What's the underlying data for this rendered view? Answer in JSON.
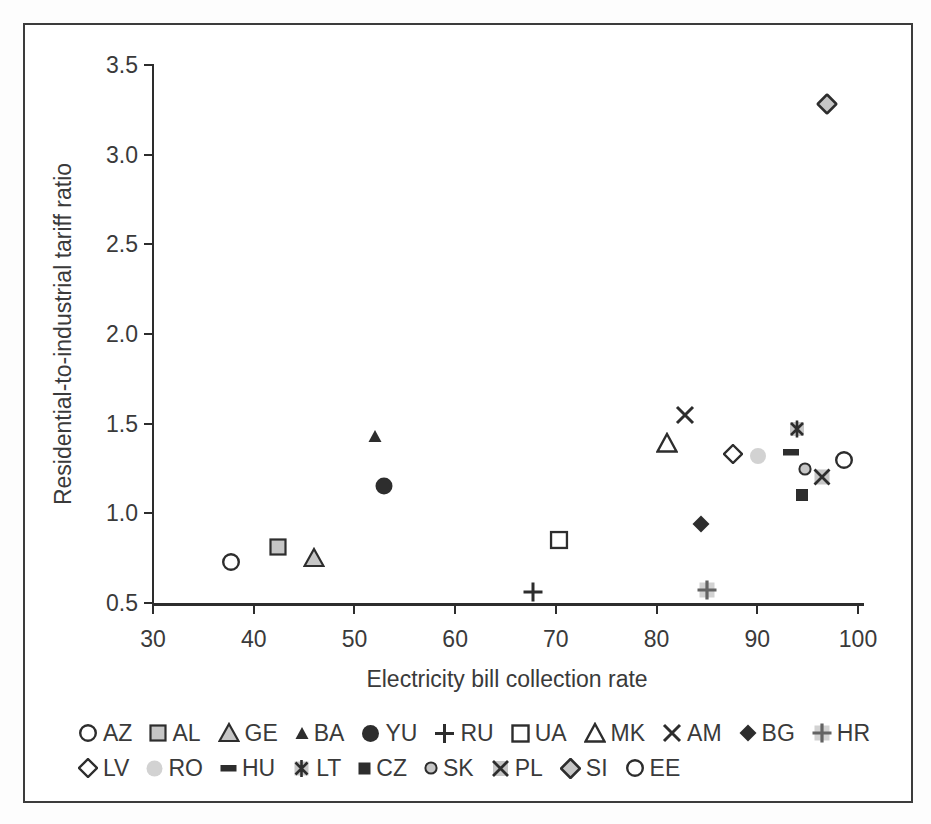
{
  "figure": {
    "border_color": "#3c3c3c",
    "background": "#ffffff"
  },
  "colors": {
    "dark": "#2d2d2d",
    "gray_fill": "#c6c6c6",
    "gray_fill_light": "#d2d2d2",
    "plus_gray": "#636363",
    "text": "#3a3a3a",
    "white": "#ffffff"
  },
  "chart_data": {
    "type": "scatter",
    "title": "",
    "xlabel": "Electricity bill collection rate",
    "ylabel": "Residential-to-industrial tariff ratio",
    "xlim": [
      30,
      100
    ],
    "ylim": [
      0.5,
      3.5
    ],
    "xticks": [
      30,
      40,
      50,
      60,
      70,
      80,
      90,
      100
    ],
    "xtick_labels": [
      "30",
      "40",
      "50",
      "60",
      "70",
      "80",
      "90",
      "100"
    ],
    "yticks": [
      0.5,
      1.0,
      1.5,
      2.0,
      2.5,
      3.0,
      3.5
    ],
    "ytick_labels": [
      "0.5",
      "1.0",
      "1.5",
      "2.0",
      "2.5",
      "3.0",
      "3.5"
    ],
    "grid": false,
    "legend_position": "bottom",
    "series": [
      {
        "name": "AZ",
        "x": 37.7,
        "y": 0.73,
        "marker": "circle-open"
      },
      {
        "name": "AL",
        "x": 42.4,
        "y": 0.81,
        "marker": "square-gray"
      },
      {
        "name": "GE",
        "x": 46.0,
        "y": 0.75,
        "marker": "triangle-gray"
      },
      {
        "name": "BA",
        "x": 52.0,
        "y": 1.43,
        "marker": "triangle-dark-small"
      },
      {
        "name": "YU",
        "x": 52.9,
        "y": 1.15,
        "marker": "circle-dark"
      },
      {
        "name": "RU",
        "x": 67.7,
        "y": 0.56,
        "marker": "plus"
      },
      {
        "name": "UA",
        "x": 70.3,
        "y": 0.85,
        "marker": "square-open"
      },
      {
        "name": "MK",
        "x": 81.0,
        "y": 1.39,
        "marker": "triangle-open"
      },
      {
        "name": "AM",
        "x": 82.8,
        "y": 1.55,
        "marker": "x"
      },
      {
        "name": "BG",
        "x": 84.4,
        "y": 0.94,
        "marker": "diamond-dark"
      },
      {
        "name": "HR",
        "x": 85.0,
        "y": 0.57,
        "marker": "plus-on-gray"
      },
      {
        "name": "LV",
        "x": 87.6,
        "y": 1.33,
        "marker": "diamond-open"
      },
      {
        "name": "RO",
        "x": 90.1,
        "y": 1.32,
        "marker": "circle-gray"
      },
      {
        "name": "HU",
        "x": 93.3,
        "y": 1.34,
        "marker": "dash-dark"
      },
      {
        "name": "LT",
        "x": 93.9,
        "y": 1.47,
        "marker": "star-on-gray"
      },
      {
        "name": "CZ",
        "x": 94.4,
        "y": 1.1,
        "marker": "square-dark-small"
      },
      {
        "name": "SK",
        "x": 94.7,
        "y": 1.25,
        "marker": "circle-gray-outlined-small"
      },
      {
        "name": "PL",
        "x": 96.4,
        "y": 1.2,
        "marker": "x-on-gray"
      },
      {
        "name": "SI",
        "x": 96.9,
        "y": 3.28,
        "marker": "diamond-gray"
      },
      {
        "name": "EE",
        "x": 98.6,
        "y": 1.3,
        "marker": "circle-open"
      }
    ],
    "legend_rows": [
      [
        "AZ",
        "AL",
        "GE",
        "BA",
        "YU",
        "RU",
        "UA",
        "MK",
        "AM",
        "BG",
        "HR"
      ],
      [
        "LV",
        "RO",
        "HU",
        "LT",
        "CZ",
        "SK",
        "PL",
        "SI",
        "EE"
      ]
    ]
  }
}
